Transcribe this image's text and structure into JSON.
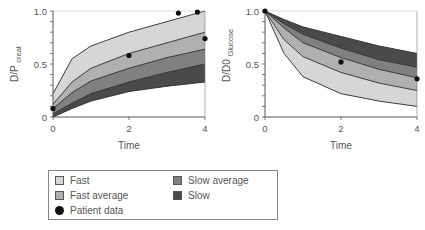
{
  "chart_data": [
    {
      "type": "area",
      "title": "",
      "xlabel": "Time",
      "ylabel": "D/P creat",
      "xlim": [
        0,
        4
      ],
      "ylim": [
        0,
        1.0
      ],
      "x_ticks": [
        "0",
        "2",
        "4"
      ],
      "y_ticks": [
        "0",
        "0.5",
        "1.0"
      ],
      "x": [
        0,
        0.5,
        1,
        2,
        3,
        4
      ],
      "boundaries": [
        {
          "name": "upper_fast",
          "values": [
            0.22,
            0.55,
            0.67,
            0.8,
            0.9,
            1.0
          ]
        },
        {
          "name": "fast_fastavg",
          "values": [
            0.12,
            0.33,
            0.46,
            0.6,
            0.7,
            0.8
          ]
        },
        {
          "name": "fastavg_slowavg",
          "values": [
            0.08,
            0.23,
            0.34,
            0.46,
            0.56,
            0.64
          ]
        },
        {
          "name": "slowavg_slow",
          "values": [
            0.03,
            0.13,
            0.22,
            0.33,
            0.42,
            0.5
          ]
        },
        {
          "name": "lower_slow",
          "values": [
            0.0,
            0.08,
            0.15,
            0.24,
            0.29,
            0.33
          ]
        }
      ],
      "series": [
        {
          "name": "Fast",
          "color": "#d6d6d6"
        },
        {
          "name": "Fast average",
          "color": "#b0b0b0"
        },
        {
          "name": "Slow average",
          "color": "#808080"
        },
        {
          "name": "Slow",
          "color": "#4a4a4a"
        }
      ],
      "patient_data": [
        {
          "x": 0,
          "y": 0.08
        },
        {
          "x": 2,
          "y": 0.58
        },
        {
          "x": 3.3,
          "y": 0.98
        },
        {
          "x": 3.8,
          "y": 0.99
        },
        {
          "x": 4,
          "y": 0.74
        }
      ]
    },
    {
      "type": "area",
      "title": "",
      "xlabel": "Time",
      "ylabel": "D/D0 Glucose",
      "xlim": [
        0,
        4
      ],
      "ylim": [
        0,
        1.0
      ],
      "x_ticks": [
        "0",
        "2",
        "4"
      ],
      "y_ticks": [
        "0",
        "0.5",
        "1.0"
      ],
      "x": [
        0,
        0.5,
        1,
        2,
        3,
        4
      ],
      "boundaries": [
        {
          "name": "upper_slow",
          "values": [
            1.0,
            0.92,
            0.85,
            0.76,
            0.67,
            0.6
          ]
        },
        {
          "name": "slow_slowavg",
          "values": [
            1.0,
            0.88,
            0.78,
            0.65,
            0.54,
            0.47
          ]
        },
        {
          "name": "slowavg_fastavg",
          "values": [
            1.0,
            0.84,
            0.7,
            0.56,
            0.45,
            0.37
          ]
        },
        {
          "name": "fastavg_fast",
          "values": [
            1.0,
            0.73,
            0.57,
            0.42,
            0.32,
            0.25
          ]
        },
        {
          "name": "lower_fast",
          "values": [
            1.0,
            0.6,
            0.38,
            0.22,
            0.15,
            0.1
          ]
        }
      ],
      "series": [
        {
          "name": "Slow",
          "color": "#4a4a4a"
        },
        {
          "name": "Slow average",
          "color": "#808080"
        },
        {
          "name": "Fast average",
          "color": "#b0b0b0"
        },
        {
          "name": "Fast",
          "color": "#d6d6d6"
        }
      ],
      "patient_data": [
        {
          "x": 0,
          "y": 1.0
        },
        {
          "x": 2,
          "y": 0.52
        },
        {
          "x": 4,
          "y": 0.36
        }
      ]
    }
  ],
  "legend": {
    "items": [
      {
        "label": "Fast",
        "color": "#d6d6d6",
        "kind": "swatch"
      },
      {
        "label": "Fast average",
        "color": "#b0b0b0",
        "kind": "swatch"
      },
      {
        "label": "Patient data",
        "color": "#111111",
        "kind": "dot"
      },
      {
        "label": "Slow average",
        "color": "#808080",
        "kind": "swatch"
      },
      {
        "label": "Slow",
        "color": "#4a4a4a",
        "kind": "swatch"
      }
    ]
  },
  "labels": {
    "left_ylabel_main": "D/P",
    "left_ylabel_sub": "creat",
    "right_ylabel_main": "D/D0",
    "right_ylabel_sub": "Glucose",
    "xlabel": "Time"
  }
}
